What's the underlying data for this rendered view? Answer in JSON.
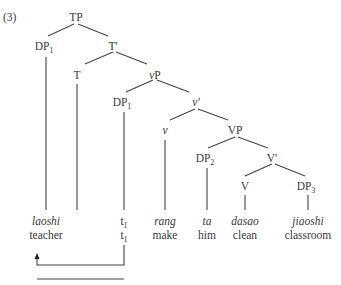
{
  "example_number": "(3)",
  "nodes": {
    "TP": {
      "label": "TP",
      "x": 76,
      "y": 18
    },
    "DP1_top": {
      "label": "DP",
      "sub": "1",
      "x": 44,
      "y": 47
    },
    "Tbar": {
      "label": "T'",
      "x": 113,
      "y": 47
    },
    "T": {
      "label": "T",
      "x": 77,
      "y": 76
    },
    "vP": {
      "label": "vP",
      "italic_prefix": "v",
      "rest": "P",
      "x": 155,
      "y": 76
    },
    "DP1_low": {
      "label": "DP",
      "sub": "1",
      "x": 122,
      "y": 103
    },
    "vbar": {
      "label": "v'",
      "x": 196,
      "y": 103
    },
    "v": {
      "label": "v",
      "x": 165,
      "y": 131
    },
    "VP": {
      "label": "VP",
      "x": 235,
      "y": 131
    },
    "DP2": {
      "label": "DP",
      "sub": "2",
      "x": 205,
      "y": 159
    },
    "Vbar": {
      "label": "V'",
      "x": 272,
      "y": 159
    },
    "V": {
      "label": "V",
      "x": 245,
      "y": 187
    },
    "DP3": {
      "label": "DP",
      "sub": "3",
      "x": 306,
      "y": 187
    }
  },
  "leaves": [
    {
      "gloss_source": "laoshi",
      "translation": "teacher",
      "x": 46
    },
    {
      "gloss_source": "t",
      "source_sub": "1",
      "translation": "t",
      "translation_sub": "1",
      "x": 124,
      "trace": true
    },
    {
      "gloss_source": "rang",
      "translation": "make",
      "x": 165
    },
    {
      "gloss_source": "ta",
      "translation": "him",
      "x": 207
    },
    {
      "gloss_source": "dasao",
      "translation": "clean",
      "x": 245
    },
    {
      "gloss_source": "jiaoshi",
      "translation": "classroom",
      "x": 308
    }
  ],
  "movement_arrow": {
    "from": "t1",
    "to": "laoshi"
  }
}
